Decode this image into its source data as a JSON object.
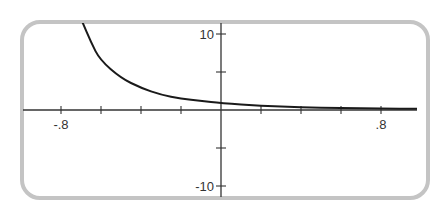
{
  "chart_data": {
    "type": "line",
    "title": "",
    "xlabel": "",
    "ylabel": "",
    "xlim": [
      -0.8,
      0.8
    ],
    "ylim": [
      -10,
      10
    ],
    "grid": false,
    "x_tick_step": 0.2,
    "y_tick_step": 5,
    "x_tick_labels": [
      {
        "value": -0.8,
        "label": "-.8"
      },
      {
        "value": 0.8,
        "label": ".8"
      }
    ],
    "y_tick_labels": [
      {
        "value": 10,
        "label": "10"
      },
      {
        "value": -10,
        "label": "-10"
      }
    ],
    "series": [
      {
        "name": "curve",
        "color": "#1a1a1a",
        "x": [
          -0.695,
          -0.65,
          -0.605,
          -0.5,
          -0.4,
          -0.3,
          -0.2,
          -0.1,
          0.0,
          0.2,
          0.4,
          0.6,
          0.8,
          0.985
        ],
        "y": [
          11.7,
          8.9,
          6.6,
          4.2,
          2.9,
          2.0,
          1.5,
          1.2,
          0.9,
          0.55,
          0.35,
          0.25,
          0.2,
          0.15
        ]
      }
    ]
  }
}
